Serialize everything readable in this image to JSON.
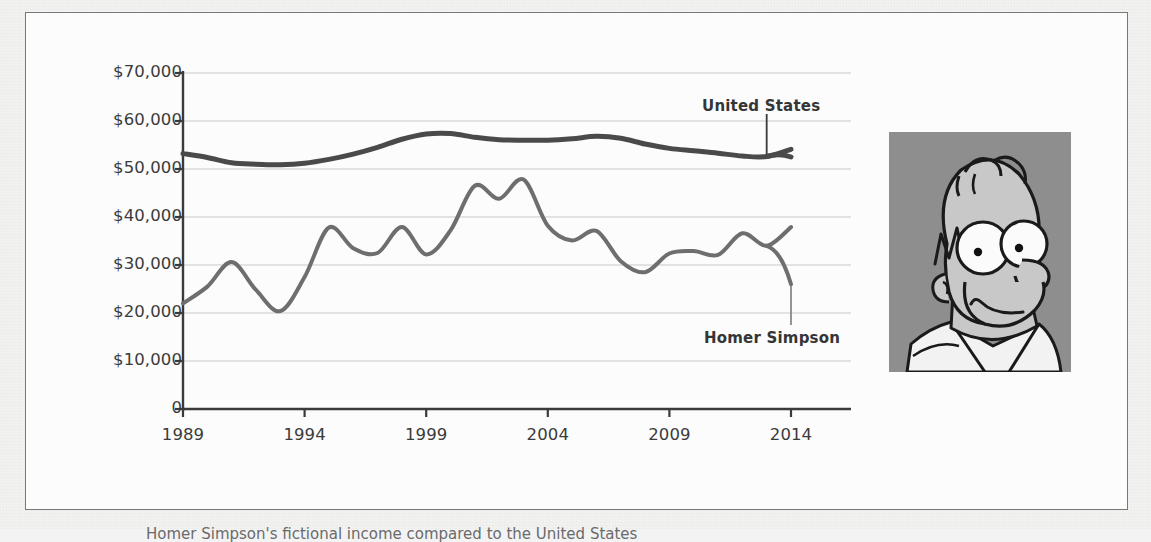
{
  "figure": {
    "caption": "Homer Simpson's fictional income compared to the United States"
  },
  "photo": {
    "alt_name": "homer-simpson-portrait",
    "background_color": "#8e8e8e",
    "skin_color": "#c8c8c8",
    "line_color": "#1a1a1a",
    "eye_color": "#fbfbfb",
    "shirt_color": "#f2f2f2"
  },
  "annotations": {
    "united_states": "United States",
    "homer_simpson": "Homer Simpson"
  },
  "chart_data": {
    "type": "line",
    "title": "",
    "xlabel": "",
    "ylabel": "",
    "grid": true,
    "legend": "inline-annotations",
    "xlim": [
      1989,
      2014
    ],
    "ylim": [
      0,
      70000
    ],
    "xticks": [
      "1989",
      "1994",
      "1999",
      "2004",
      "2009",
      "2014"
    ],
    "xtick_values": [
      1989,
      1994,
      1999,
      2004,
      2009,
      2014
    ],
    "yticks": [
      "0",
      "$10,000",
      "$20,000",
      "$30,000",
      "$40,000",
      "$50,000",
      "$60,000",
      "$70,000"
    ],
    "ytick_values": [
      0,
      10000,
      20000,
      30000,
      40000,
      50000,
      60000,
      70000
    ],
    "x": [
      1989,
      1990,
      1991,
      1992,
      1993,
      1994,
      1995,
      1996,
      1997,
      1998,
      1999,
      2000,
      2001,
      2002,
      2003,
      2004,
      2005,
      2006,
      2007,
      2008,
      2009,
      2010,
      2011,
      2012,
      2013,
      2014
    ],
    "series": [
      {
        "name": "United States",
        "color": "#4a4a4a",
        "line_width": 5,
        "values": [
          53200,
          52400,
          51300,
          51000,
          50900,
          51200,
          52000,
          53100,
          54500,
          56200,
          57300,
          57400,
          56600,
          56100,
          56000,
          56000,
          56300,
          56800,
          56400,
          55200,
          54300,
          53800,
          53300,
          52700,
          52600,
          54100
        ]
      },
      {
        "name": "Homer Simpson",
        "color": "#6e6e6e",
        "line_width": 4,
        "values": [
          22000,
          25500,
          30600,
          24800,
          20400,
          27500,
          37800,
          33500,
          32500,
          37900,
          32200,
          37200,
          46500,
          43800,
          47800,
          38200,
          35100,
          37100,
          30800,
          28500,
          32400,
          32900,
          32100,
          36600,
          34000,
          37900
        ]
      }
    ],
    "series_full": {
      "united_states_end_value": 52500,
      "homer_simpson_end_value": 26000
    }
  }
}
